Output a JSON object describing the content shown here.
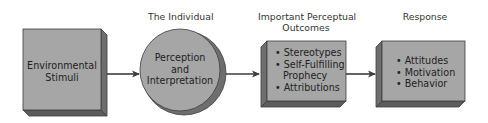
{
  "colors": {
    "face": "#a6a6a6",
    "side": "#6e6e6e",
    "edge": "#3d3d3d",
    "arrow": "#3d3d3d",
    "text": "#222222",
    "background": "#ffffff"
  },
  "headers": {
    "individual": "The Individual",
    "outcomes_line1": "Important Perceptual",
    "outcomes_line2": "Outcomes",
    "response": "Response"
  },
  "nodes": {
    "stimuli": {
      "line1": "Environmental",
      "line2": "Stimuli"
    },
    "perception": {
      "line1": "Perception",
      "line2": "and",
      "line3": "Interpretation"
    },
    "outcomes": {
      "items": [
        "• Stereotypes",
        "• Self-Fulfilling",
        "Prophecy",
        "• Attributions"
      ]
    },
    "response": {
      "items": [
        "• Attitudes",
        "• Motivation",
        "• Behavior"
      ]
    }
  },
  "edges": [
    {
      "from": "stimuli",
      "to": "perception"
    },
    {
      "from": "perception",
      "to": "outcomes"
    },
    {
      "from": "outcomes",
      "to": "response"
    }
  ]
}
